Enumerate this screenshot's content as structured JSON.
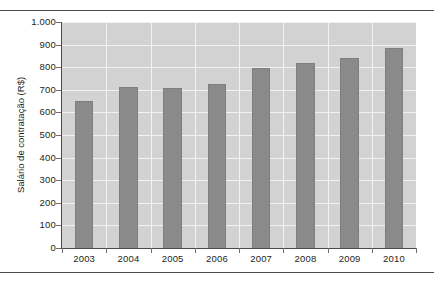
{
  "chart_data": {
    "type": "bar",
    "title": "",
    "subtitle": "",
    "xlabel": "",
    "ylabel": "Salário de contratação (R$)",
    "categories": [
      "2003",
      "2004",
      "2005",
      "2006",
      "2007",
      "2008",
      "2009",
      "2010"
    ],
    "values": [
      650,
      712,
      710,
      728,
      795,
      820,
      840,
      885
    ],
    "series": [
      {
        "name": "Salário de contratação (R$)",
        "values": [
          650,
          712,
          710,
          728,
          795,
          820,
          840,
          885
        ]
      }
    ],
    "ylim": [
      0,
      1000
    ],
    "y_ticks": [
      0,
      100,
      200,
      300,
      400,
      500,
      600,
      700,
      800,
      900,
      1000
    ],
    "y_tick_labels": [
      "0",
      "100",
      "200",
      "300",
      "400",
      "500",
      "600",
      "700",
      "800",
      "900",
      "1.000"
    ],
    "grid": true,
    "grid_orientation": "both",
    "legend": false,
    "legend_position": "none",
    "bar_color": "#8a8a8a",
    "plot_background": "#d2d2d2",
    "gridline_color": "#f2f2f2",
    "axis_color": "#4a4a4a",
    "page_background": "#ffffff"
  }
}
